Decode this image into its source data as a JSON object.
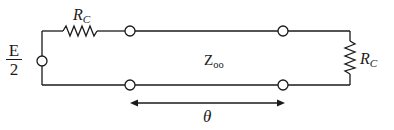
{
  "diagram": {
    "type": "transmission-line-circuit",
    "source": {
      "label_numerator": "E",
      "label_denominator": "2"
    },
    "source_resistor": {
      "label_main": "R",
      "label_sub": "C"
    },
    "load_resistor": {
      "label_main": "R",
      "label_sub": "C"
    },
    "line": {
      "impedance_main": "Z",
      "impedance_sub": "oo"
    },
    "length": {
      "label": "θ"
    },
    "colors": {
      "stroke": "#1a1a1a",
      "background": "#ffffff"
    }
  }
}
